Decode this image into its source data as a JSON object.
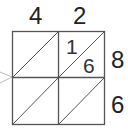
{
  "problem": {
    "type": "lattice-multiplication",
    "top_digits": [
      "4",
      "2"
    ],
    "side_digits": [
      "8",
      "6"
    ],
    "cells": [
      {
        "row": 0,
        "col": 0,
        "tens": "",
        "ones": ""
      },
      {
        "row": 0,
        "col": 1,
        "tens": "1",
        "ones": "6"
      },
      {
        "row": 1,
        "col": 0,
        "tens": "",
        "ones": ""
      },
      {
        "row": 1,
        "col": 1,
        "tens": "",
        "ones": ""
      }
    ]
  },
  "colors": {
    "grid_line": "#555555",
    "digit": "#222222",
    "arrow": "#bbbbbb"
  }
}
